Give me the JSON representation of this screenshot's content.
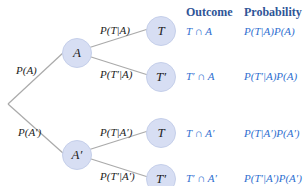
{
  "headers": {
    "outcome": "Outcome",
    "probability": "Probability"
  },
  "colors": {
    "node_fill": "#d7def3",
    "header": "#2f5597",
    "cell": "#2f6fd0",
    "edge": "#aaaaaa"
  },
  "root_branches": [
    {
      "label": "P(A)"
    },
    {
      "label": "P(A′)"
    }
  ],
  "nodes": {
    "A": "A",
    "A_prime": "A′",
    "T1": "T",
    "T1_prime": "T′",
    "T2": "T",
    "T2_prime": "T′"
  },
  "branches": {
    "T_given_A": "P(T|A)",
    "Tp_given_A": "P(T′|A)",
    "T_given_Ap": "P(T|A′)",
    "Tp_given_Ap": "P(T′|A′)"
  },
  "rows": [
    {
      "outcome": "T ∩ A",
      "probability": "P(T|A)P(A)"
    },
    {
      "outcome": "T′ ∩ A",
      "probability": "P(T′|A)P(A)"
    },
    {
      "outcome": "T ∩ A′",
      "probability": "P(T|A′)P(A′)"
    },
    {
      "outcome": "T′ ∩ A′",
      "probability": "P(T′|A′)P(A′)"
    }
  ]
}
